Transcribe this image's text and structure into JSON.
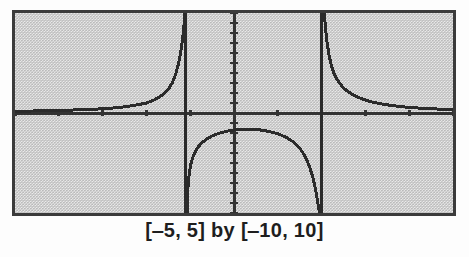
{
  "figure": {
    "caption": "[‒5, 5] by [‒10, 10]",
    "frame": {
      "border_color": "#3b3b3b",
      "screen_color": "#c9c9c9",
      "curve_color": "#2b2b2b",
      "axis_color": "#333333"
    }
  },
  "chart_data": {
    "type": "line",
    "title": "",
    "subtitle": "",
    "xlabel": "",
    "ylabel": "",
    "caption": "[‒5, 5] by [‒10, 10]",
    "xlim": [
      -5,
      5
    ],
    "ylim": [
      -10,
      10
    ],
    "xtick_step": 1,
    "ytick_step": 1,
    "xticks": [
      -5,
      -4,
      -3,
      -2,
      -1,
      0,
      1,
      2,
      3,
      4,
      5
    ],
    "yticks": [
      -10,
      -9,
      -8,
      -7,
      -6,
      -5,
      -4,
      -3,
      -2,
      -1,
      0,
      1,
      2,
      3,
      4,
      5,
      6,
      7,
      8,
      9,
      10
    ],
    "grid": false,
    "legend": false,
    "legend_position": "none",
    "axes_drawn": [
      "x-axis",
      "y-axis"
    ],
    "vertical_asymptotes": [
      -1.1,
      2.0
    ],
    "annotations": [],
    "series": [
      {
        "name": "left-branch",
        "note": "approaches 0 from above for x far negative, rises to +infinity at left asymptote",
        "x": [
          -5.0,
          -4.6,
          -4.2,
          -3.8,
          -3.4,
          -3.0,
          -2.7,
          -2.45,
          -2.2,
          -2.0,
          -1.85,
          -1.7,
          -1.58,
          -1.48,
          -1.4,
          -1.33,
          -1.27,
          -1.22,
          -1.18,
          -1.15,
          -1.13,
          -1.12
        ],
        "y": [
          0.18,
          0.2,
          0.24,
          0.28,
          0.34,
          0.42,
          0.52,
          0.64,
          0.82,
          1.0,
          1.25,
          1.6,
          2.0,
          2.5,
          3.1,
          3.9,
          4.9,
          6.0,
          7.2,
          8.4,
          9.4,
          10.0
        ]
      },
      {
        "name": "middle-branch",
        "note": "dome below the x-axis, peak near y = -1.6 at x = 0.3, falls to -infinity at both asymptotes",
        "x": [
          -1.07,
          -1.06,
          -1.05,
          -1.02,
          -0.98,
          -0.92,
          -0.84,
          -0.74,
          -0.62,
          -0.48,
          -0.32,
          -0.14,
          0.05,
          0.25,
          0.45,
          0.65,
          0.85,
          1.02,
          1.2,
          1.36,
          1.5,
          1.62,
          1.72,
          1.8,
          1.86,
          1.9,
          1.93,
          1.95
        ],
        "y": [
          -10.0,
          -8.6,
          -7.4,
          -6.0,
          -5.0,
          -4.2,
          -3.5,
          -3.0,
          -2.6,
          -2.25,
          -2.0,
          -1.8,
          -1.66,
          -1.6,
          -1.63,
          -1.72,
          -1.9,
          -2.1,
          -2.45,
          -2.9,
          -3.5,
          -4.3,
          -5.3,
          -6.4,
          -7.6,
          -8.6,
          -9.4,
          -10.0
        ]
      },
      {
        "name": "right-branch",
        "note": "falls from +infinity at right asymptote and flattens toward 0 as x increases",
        "x": [
          2.06,
          2.08,
          2.1,
          2.13,
          2.17,
          2.22,
          2.28,
          2.36,
          2.46,
          2.58,
          2.72,
          2.9,
          3.1,
          3.35,
          3.6,
          3.9,
          4.2,
          4.55,
          4.8,
          5.0
        ],
        "y": [
          10.0,
          9.0,
          8.0,
          6.9,
          5.8,
          4.8,
          4.0,
          3.3,
          2.7,
          2.2,
          1.8,
          1.45,
          1.15,
          0.92,
          0.75,
          0.6,
          0.5,
          0.42,
          0.36,
          0.33
        ]
      }
    ]
  }
}
